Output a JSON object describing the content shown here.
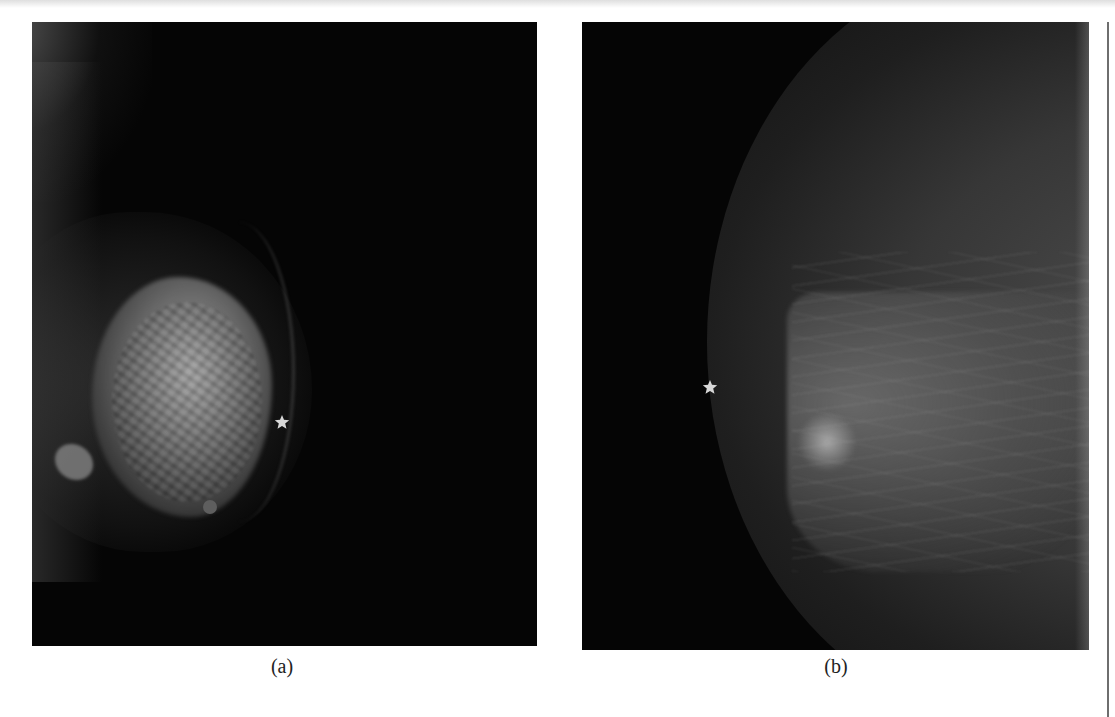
{
  "figure": {
    "panels": [
      {
        "id": "a",
        "caption": "(a)",
        "image_description": "Dense grayscale mammogram with a bright irregular fibroglandular mass and a small round marker",
        "markers": [
          {
            "type": "star",
            "label": "star-marker"
          },
          {
            "type": "circle",
            "label": "round-marker"
          }
        ]
      },
      {
        "id": "b",
        "caption": "(b)",
        "image_description": "Grayscale mammogram showing a breast outline with fibrous strands",
        "markers": [
          {
            "type": "star",
            "label": "star-marker"
          }
        ]
      }
    ]
  },
  "colors": {
    "background": "#ffffff",
    "image_background": "#050505",
    "marker": "#d8d8d8",
    "caption_text": "#222222",
    "rule": "#6e6e6e"
  }
}
